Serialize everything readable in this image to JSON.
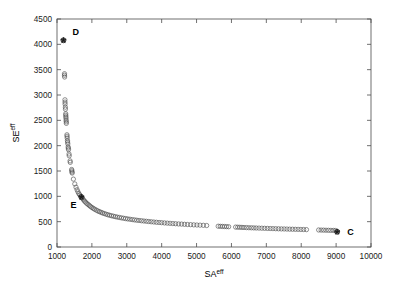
{
  "chart_data": {
    "type": "scatter",
    "title": "",
    "xlabel": "SA",
    "xlabel_sup": "eff",
    "ylabel": "SE",
    "ylabel_sup": "eff",
    "xlim": [
      1000,
      10000
    ],
    "ylim": [
      0,
      4500
    ],
    "xticks": [
      1000,
      2000,
      3000,
      4000,
      5000,
      6000,
      7000,
      8000,
      9000,
      10000
    ],
    "yticks": [
      0,
      500,
      1000,
      1500,
      2000,
      2500,
      3000,
      3500,
      4000,
      4500
    ],
    "xtick_labels": [
      "1000",
      "2000",
      "3000",
      "4000",
      "5000",
      "6000",
      "7000",
      "8000",
      "9000",
      "10000"
    ],
    "ytick_labels": [
      "0",
      "500",
      "1000",
      "1500",
      "2000",
      "2500",
      "3000",
      "3500",
      "4000",
      "4500"
    ],
    "grid": false,
    "legend": null,
    "marker_style": "open-circle",
    "marker_color": "#4a4a4a",
    "axis_color": "#4d4d4d",
    "series": [
      {
        "name": "Pareto front solutions",
        "marker": "open-circle",
        "points": [
          [
            1185,
            4080
          ],
          [
            1215,
            3420
          ],
          [
            1215,
            3390
          ],
          [
            1218,
            3355
          ],
          [
            1228,
            2905
          ],
          [
            1230,
            2860
          ],
          [
            1232,
            2820
          ],
          [
            1240,
            2760
          ],
          [
            1242,
            2720
          ],
          [
            1250,
            2630
          ],
          [
            1252,
            2600
          ],
          [
            1255,
            2570
          ],
          [
            1258,
            2540
          ],
          [
            1262,
            2500
          ],
          [
            1265,
            2470
          ],
          [
            1268,
            2440
          ],
          [
            1285,
            2215
          ],
          [
            1288,
            2185
          ],
          [
            1292,
            2150
          ],
          [
            1300,
            2100
          ],
          [
            1305,
            2070
          ],
          [
            1310,
            2035
          ],
          [
            1320,
            1975
          ],
          [
            1325,
            1950
          ],
          [
            1330,
            1920
          ],
          [
            1345,
            1835
          ],
          [
            1350,
            1800
          ],
          [
            1375,
            1700
          ],
          [
            1380,
            1670
          ],
          [
            1420,
            1530
          ],
          [
            1425,
            1505
          ],
          [
            1430,
            1480
          ],
          [
            1435,
            1460
          ],
          [
            1470,
            1340
          ],
          [
            1510,
            1245
          ],
          [
            1545,
            1180
          ],
          [
            1575,
            1130
          ],
          [
            1600,
            1090
          ],
          [
            1625,
            1055
          ],
          [
            1650,
            1030
          ],
          [
            1680,
            1005
          ],
          [
            1700,
            985
          ],
          [
            1730,
            960
          ],
          [
            1760,
            930
          ],
          [
            1790,
            905
          ],
          [
            1820,
            885
          ],
          [
            1855,
            860
          ],
          [
            1890,
            840
          ],
          [
            1925,
            820
          ],
          [
            1960,
            800
          ],
          [
            2000,
            780
          ],
          [
            2040,
            762
          ],
          [
            2080,
            745
          ],
          [
            2125,
            728
          ],
          [
            2170,
            712
          ],
          [
            2215,
            698
          ],
          [
            2260,
            685
          ],
          [
            2305,
            672
          ],
          [
            2355,
            660
          ],
          [
            2405,
            648
          ],
          [
            2455,
            637
          ],
          [
            2505,
            627
          ],
          [
            2560,
            617
          ],
          [
            2615,
            608
          ],
          [
            2670,
            599
          ],
          [
            2725,
            591
          ],
          [
            2785,
            583
          ],
          [
            2845,
            575
          ],
          [
            2905,
            568
          ],
          [
            2965,
            561
          ],
          [
            3025,
            554
          ],
          [
            3090,
            548
          ],
          [
            3155,
            541
          ],
          [
            3220,
            535
          ],
          [
            3285,
            529
          ],
          [
            3350,
            524
          ],
          [
            3420,
            518
          ],
          [
            3490,
            513
          ],
          [
            3560,
            508
          ],
          [
            3630,
            503
          ],
          [
            3700,
            498
          ],
          [
            3775,
            493
          ],
          [
            3850,
            488
          ],
          [
            3925,
            484
          ],
          [
            4000,
            480
          ],
          [
            4080,
            475
          ],
          [
            4160,
            471
          ],
          [
            4240,
            467
          ],
          [
            4320,
            463
          ],
          [
            4400,
            459
          ],
          [
            4485,
            455
          ],
          [
            4570,
            452
          ],
          [
            4655,
            448
          ],
          [
            4740,
            444
          ],
          [
            4830,
            441
          ],
          [
            4920,
            437
          ],
          [
            5010,
            434
          ],
          [
            5100,
            431
          ],
          [
            5195,
            428
          ],
          [
            5290,
            424
          ],
          [
            5620,
            410
          ],
          [
            5680,
            408
          ],
          [
            5740,
            406
          ],
          [
            5800,
            404
          ],
          [
            5860,
            402
          ],
          [
            5920,
            400
          ],
          [
            6120,
            393
          ],
          [
            6180,
            391
          ],
          [
            6240,
            389
          ],
          [
            6300,
            387
          ],
          [
            6360,
            385
          ],
          [
            6430,
            383
          ],
          [
            6500,
            381
          ],
          [
            6570,
            379
          ],
          [
            6640,
            377
          ],
          [
            6710,
            375
          ],
          [
            6790,
            373
          ],
          [
            6870,
            371
          ],
          [
            6950,
            369
          ],
          [
            7030,
            367
          ],
          [
            7110,
            365
          ],
          [
            7190,
            363
          ],
          [
            7270,
            361
          ],
          [
            7350,
            359
          ],
          [
            7430,
            357
          ],
          [
            7510,
            356
          ],
          [
            7590,
            354
          ],
          [
            7670,
            352
          ],
          [
            7750,
            351
          ],
          [
            7830,
            349
          ],
          [
            7910,
            348
          ],
          [
            7990,
            346
          ],
          [
            8070,
            345
          ],
          [
            8150,
            343
          ],
          [
            8500,
            336
          ],
          [
            8570,
            334
          ],
          [
            8640,
            333
          ],
          [
            8710,
            331
          ],
          [
            8780,
            330
          ],
          [
            8850,
            328
          ],
          [
            8920,
            327
          ],
          [
            8980,
            325
          ],
          [
            9030,
            300
          ]
        ]
      }
    ],
    "annotations": [
      {
        "label": "D",
        "x": 1185,
        "y": 4080,
        "marker": "filled-star-in-circle",
        "label_dx": 9,
        "label_dy": -5
      },
      {
        "label": "E",
        "x": 1700,
        "y": 985,
        "marker": "filled-star-in-circle",
        "label_dx": -11,
        "label_dy": 11
      },
      {
        "label": "C",
        "x": 9030,
        "y": 300,
        "marker": "filled-star-in-circle",
        "label_dx": 10,
        "label_dy": 3
      }
    ]
  }
}
